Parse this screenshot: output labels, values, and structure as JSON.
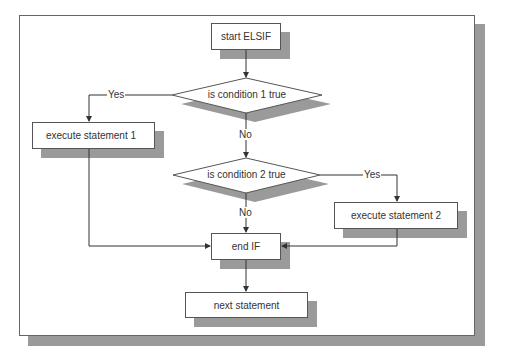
{
  "diagram": {
    "nodes": {
      "start": "start ELSIF",
      "cond1": "is condition 1 true",
      "exec1": "execute statement 1",
      "cond2": "is condition 2 true",
      "exec2": "execute statement 2",
      "endif": "end IF",
      "next": "next statement"
    },
    "edges": {
      "cond1_yes": "Yes",
      "cond1_no": "No",
      "cond2_yes": "Yes",
      "cond2_no": "No"
    }
  }
}
